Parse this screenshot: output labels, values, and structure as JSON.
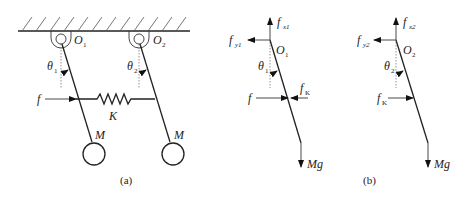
{
  "figure": {
    "panel_a": {
      "caption": "(a)",
      "pivot_1_label": "O",
      "pivot_1_sub": "1",
      "pivot_2_label": "O",
      "pivot_2_sub": "2",
      "angle_1_label": "θ",
      "angle_1_sub": "1",
      "angle_2_label": "θ",
      "angle_2_sub": "2",
      "force_label": "f",
      "spring_label": "K",
      "mass_1_label": "M",
      "mass_2_label": "M"
    },
    "panel_b": {
      "caption": "(b)",
      "body_1": {
        "pivot_label": "O",
        "pivot_sub": "1",
        "fx_label": "f",
        "fx_sub": "x1",
        "fy_label": "f",
        "fy_sub": "y1",
        "angle_label": "θ",
        "angle_sub": "1",
        "external_force_label": "f",
        "spring_force_label": "f",
        "spring_force_sub": "K",
        "weight_label": "Mg"
      },
      "body_2": {
        "pivot_label": "O",
        "pivot_sub": "2",
        "fx_label": "f",
        "fx_sub": "x2",
        "fy_label": "f",
        "fy_sub": "y2",
        "angle_label": "θ",
        "angle_sub": "2",
        "spring_force_label": "f",
        "spring_force_sub": "K",
        "weight_label": "Mg"
      }
    }
  }
}
